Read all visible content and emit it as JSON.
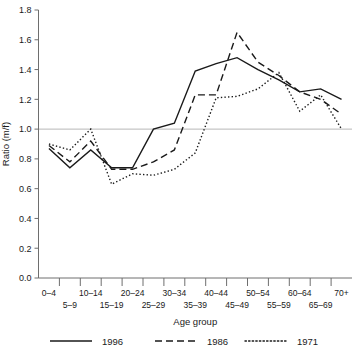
{
  "chart_data": {
    "type": "line",
    "title": "",
    "xlabel": "Age group",
    "ylabel": "Ratio (m/f)",
    "categories": [
      "0–4",
      "5–9",
      "10–14",
      "15–19",
      "20–24",
      "25–29",
      "30–34",
      "35–39",
      "40–44",
      "45–49",
      "50–54",
      "55–59",
      "60–64",
      "65–69",
      "70+"
    ],
    "ylim": [
      0.0,
      1.8
    ],
    "yticks": [
      "0.0",
      "0.2",
      "0.4",
      "0.6",
      "0.8",
      "1.0",
      "1.2",
      "1.4",
      "1.6",
      "1.8"
    ],
    "ytick_values": [
      0.0,
      0.2,
      0.4,
      0.6,
      0.8,
      1.0,
      1.2,
      1.4,
      1.6,
      1.8
    ],
    "grid": false,
    "reference_line": 1.0,
    "legend_position": "bottom",
    "series": [
      {
        "name": "1996",
        "style": "solid",
        "values": [
          0.87,
          0.74,
          0.86,
          0.74,
          0.74,
          1.0,
          1.04,
          1.39,
          1.44,
          1.48,
          1.4,
          1.33,
          1.25,
          1.27,
          1.2
        ]
      },
      {
        "name": "1986",
        "style": "dashed",
        "values": [
          0.89,
          0.78,
          0.92,
          0.73,
          0.73,
          0.78,
          0.86,
          1.23,
          1.23,
          1.65,
          1.45,
          1.36,
          1.25,
          1.2,
          1.1
        ]
      },
      {
        "name": "1971",
        "style": "dotted",
        "values": [
          0.9,
          0.86,
          1.0,
          0.63,
          0.7,
          0.69,
          0.73,
          0.84,
          1.21,
          1.22,
          1.27,
          1.38,
          1.12,
          1.23,
          1.0
        ]
      }
    ]
  },
  "axes": {
    "ylabel": "Ratio (m/f)",
    "xlabel": "Age group"
  },
  "legend": {
    "entries": [
      {
        "label": "1996",
        "style": "solid"
      },
      {
        "label": "1986",
        "style": "dashed"
      },
      {
        "label": "1971",
        "style": "dotted"
      }
    ]
  },
  "colors": {
    "line": "#1a1a1a",
    "axis": "#6e6e6e",
    "reference": "#b8b8b8",
    "background": "#ffffff"
  }
}
